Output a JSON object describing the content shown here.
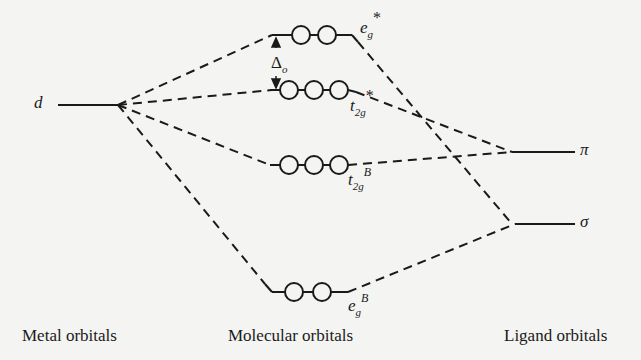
{
  "diagram": {
    "type": "molecular-orbital-energy-diagram",
    "columns": {
      "metal": "Metal orbitals",
      "molecular": "Molecular orbitals",
      "ligand": "Ligand orbitals"
    },
    "metal_levels": [
      {
        "label": "d"
      }
    ],
    "ligand_levels": [
      {
        "label": "π"
      },
      {
        "label": "σ"
      }
    ],
    "molecular_levels": [
      {
        "id": "eg_star",
        "base": "e",
        "sub": "g",
        "sup": "*",
        "orbitals": 2
      },
      {
        "id": "t2g_star",
        "base": "t",
        "sub": "2g",
        "sup": "*",
        "orbitals": 3
      },
      {
        "id": "t2g_B",
        "base": "t",
        "sub": "2g",
        "sup": "B",
        "orbitals": 3
      },
      {
        "id": "eg_B",
        "base": "e",
        "sub": "g",
        "sup": "B",
        "orbitals": 2
      }
    ],
    "splitting": {
      "symbol": "Δ",
      "sub": "o"
    }
  }
}
